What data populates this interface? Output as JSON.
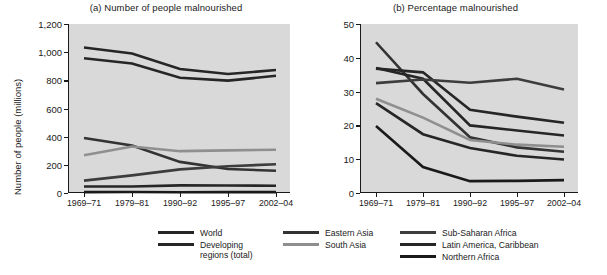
{
  "figure": {
    "panel_a": {
      "title": "(a) Number of people malnourished",
      "ylabel": "Number of people (millions)"
    },
    "panel_b": {
      "title": "(b) Percentage malnourished",
      "ylabel": "Percentage"
    }
  },
  "legend": {
    "columns": [
      {
        "items": [
          {
            "label": "World",
            "color": "#262626"
          },
          {
            "label": "Developing\nregions (total)",
            "color": "#262626"
          }
        ]
      },
      {
        "items": [
          {
            "label": "Eastern Asia",
            "color": "#333333"
          },
          {
            "label": "South Asia",
            "color": "#8f8f8f"
          }
        ]
      },
      {
        "items": [
          {
            "label": "Sub-Saharan Africa",
            "color": "#3d3d3d"
          },
          {
            "label": "Latin America, Caribbean",
            "color": "#262626"
          },
          {
            "label": "Northern Africa",
            "color": "#1a1a1a"
          }
        ]
      }
    ]
  },
  "chart_data": [
    {
      "type": "line",
      "title": "(a) Number of people malnourished",
      "xlabel": "",
      "ylabel": "Number of people (millions)",
      "categories": [
        "1969–71",
        "1979–81",
        "1990–92",
        "1995–97",
        "2002–04"
      ],
      "ylim": [
        0,
        1200
      ],
      "yticks": [
        0,
        200,
        400,
        600,
        800,
        1000,
        1200
      ],
      "ytick_labels": [
        "0",
        "200",
        "400",
        "600",
        "800",
        "1,000",
        "1,200"
      ],
      "grid": false,
      "legend_position": "bottom",
      "series": [
        {
          "name": "World",
          "color": "#262626",
          "values": [
            1033,
            990,
            880,
            845,
            873
          ]
        },
        {
          "name": "Developing regions (total)",
          "color": "#262626",
          "values": [
            957,
            920,
            818,
            798,
            832
          ]
        },
        {
          "name": "Eastern Asia",
          "color": "#333333",
          "values": [
            391,
            337,
            221,
            170,
            158
          ]
        },
        {
          "name": "South Asia",
          "color": "#8f8f8f",
          "values": [
            268,
            330,
            297,
            303,
            307
          ]
        },
        {
          "name": "Sub-Saharan Africa",
          "color": "#3d3d3d",
          "values": [
            88,
            125,
            168,
            190,
            204
          ]
        },
        {
          "name": "Latin America, Caribbean",
          "color": "#262626",
          "values": [
            46,
            46,
            54,
            53,
            52
          ]
        },
        {
          "name": "Northern Africa",
          "color": "#1a1a1a",
          "values": [
            6,
            7,
            5,
            6,
            6
          ]
        }
      ]
    },
    {
      "type": "line",
      "title": "(b) Percentage malnourished",
      "xlabel": "",
      "ylabel": "Percentage",
      "categories": [
        "1969–71",
        "1979–81",
        "1990–92",
        "1995–97",
        "2002–04"
      ],
      "ylim": [
        0,
        50
      ],
      "yticks": [
        0,
        10,
        20,
        30,
        40,
        50
      ],
      "ytick_labels": [
        "0",
        "10",
        "20",
        "30",
        "40",
        "50"
      ],
      "grid": false,
      "legend_position": "bottom",
      "series": [
        {
          "name": "Eastern Asia",
          "color": "#333333",
          "values": [
            44.6,
            29.3,
            16.5,
            13.5,
            12.2
          ]
        },
        {
          "name": "World",
          "color": "#262626",
          "values": [
            37.0,
            33.8,
            20.0,
            18.5,
            17.0
          ]
        },
        {
          "name": "Developing regions (total)",
          "color": "#262626",
          "values": [
            36.8,
            35.7,
            24.6,
            22.6,
            20.8
          ]
        },
        {
          "name": "Sub-Saharan Africa",
          "color": "#3d3d3d",
          "values": [
            32.5,
            33.6,
            32.6,
            33.8,
            30.6
          ]
        },
        {
          "name": "South Asia",
          "color": "#8f8f8f",
          "values": [
            27.9,
            22.3,
            15.7,
            14.3,
            13.7
          ]
        },
        {
          "name": "Latin America, Caribbean",
          "color": "#262626",
          "values": [
            26.6,
            17.4,
            13.3,
            11.0,
            9.9
          ]
        },
        {
          "name": "Northern Africa",
          "color": "#1a1a1a",
          "values": [
            19.8,
            7.7,
            3.5,
            3.6,
            3.8
          ]
        }
      ]
    }
  ]
}
